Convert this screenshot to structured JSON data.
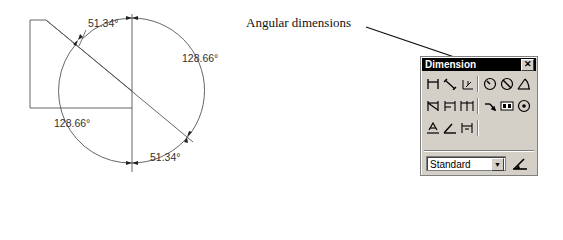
{
  "drawing": {
    "dimensions": [
      {
        "id": "top-left",
        "label": "51.34°"
      },
      {
        "id": "right",
        "label": "128.66°"
      },
      {
        "id": "bottom-left",
        "label": "128.66°"
      },
      {
        "id": "bottom-right",
        "label": "51.34°"
      }
    ]
  },
  "callout": {
    "text": "Angular dimensions"
  },
  "toolbar": {
    "title": "Dimension",
    "close_label": "✕",
    "rows": [
      [
        {
          "name": "linear-dimension-icon"
        },
        {
          "name": "aligned-dimension-icon"
        },
        {
          "name": "ordinate-dimension-icon"
        },
        {
          "sep": true
        },
        {
          "name": "radius-dimension-icon"
        },
        {
          "name": "diameter-dimension-icon"
        },
        {
          "name": "angular-dimension-icon"
        }
      ],
      [
        {
          "name": "quick-dimension-icon"
        },
        {
          "name": "baseline-dimension-icon"
        },
        {
          "name": "continue-dimension-icon"
        },
        {
          "sep": true
        },
        {
          "name": "leader-icon"
        },
        {
          "name": "tolerance-icon"
        },
        {
          "name": "center-mark-icon"
        }
      ],
      [
        {
          "name": "dimension-edit-icon"
        },
        {
          "name": "dimension-text-edit-icon"
        },
        {
          "name": "dimension-update-icon"
        }
      ]
    ],
    "style_select": {
      "value": "Standard",
      "arrow": "▼"
    }
  },
  "colors": {
    "toolbar_bg": "#d4d0c8",
    "title_bg": "#000000",
    "line": "#444444"
  }
}
